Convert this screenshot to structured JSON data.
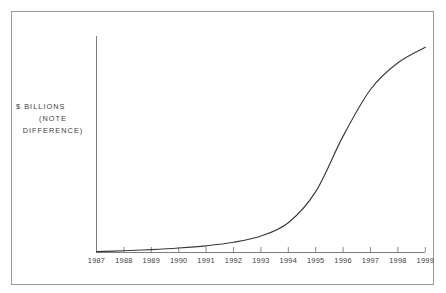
{
  "chart_data": {
    "type": "line",
    "title": "",
    "xlabel": "",
    "ylabel": "$ BILLIONS (NOTE DIFFERENCE)",
    "categories": [
      "1987",
      "1988",
      "1989",
      "1990",
      "1991",
      "1992",
      "1993",
      "1994",
      "1995",
      "1996",
      "1997",
      "1998",
      "1999"
    ],
    "x": [
      1987,
      1988,
      1989,
      1990,
      1991,
      1992,
      1993,
      1994,
      1995,
      1996,
      1997,
      1998,
      1999
    ],
    "values": [
      0.0,
      0.4,
      0.9,
      1.6,
      2.6,
      4.2,
      7.0,
      13.0,
      27.0,
      52.0,
      73.0,
      85.0,
      92.0
    ],
    "series": [
      {
        "name": "Growth curve",
        "values": [
          0.0,
          0.4,
          0.9,
          1.6,
          2.6,
          4.2,
          7.0,
          13.0,
          27.0,
          52.0,
          73.0,
          85.0,
          92.0
        ]
      }
    ],
    "xlim": [
      1987,
      1999
    ],
    "ylim": [
      0,
      100
    ],
    "grid": false,
    "legend": "none",
    "curve_shape": "sigmoid",
    "inflection_year": 1995.5,
    "y_axis_ticks_shown": false,
    "y_axis_numbers_shown": false,
    "line_color": "#3a3a3a",
    "axis_color": "#7d7d7d",
    "frame_color": "#9a9a9a",
    "background_color": "#ffffff"
  },
  "chart": {
    "title": "",
    "y_caption": {
      "line1": "$ BILLIONS",
      "line2": "(NOTE",
      "line3": "DIFFERENCE)"
    },
    "x_ticks": [
      {
        "label": "1987"
      },
      {
        "label": "1988"
      },
      {
        "label": "1989"
      },
      {
        "label": "1990"
      },
      {
        "label": "1991"
      },
      {
        "label": "1992"
      },
      {
        "label": "1993"
      },
      {
        "label": "1994"
      },
      {
        "label": "1995"
      },
      {
        "label": "1996"
      },
      {
        "label": "1997"
      },
      {
        "label": "1998"
      },
      {
        "label": "1999"
      }
    ]
  }
}
